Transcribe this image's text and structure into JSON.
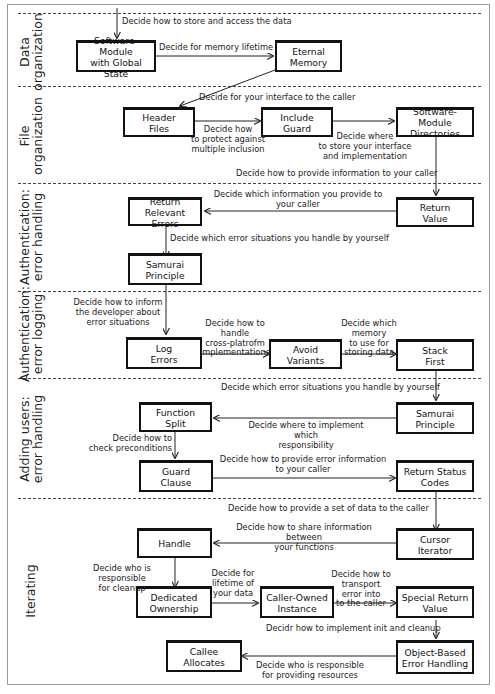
{
  "sections": [
    {
      "id": "data-organization",
      "label": "Data\norganization"
    },
    {
      "id": "file-organization",
      "label": "File\norganization"
    },
    {
      "id": "auth-error-handling",
      "label": "Authentication:\nerror handling"
    },
    {
      "id": "auth-error-logging",
      "label": "Authentication:\nerror logging"
    },
    {
      "id": "adding-users-error-handling",
      "label": "Adding users:\nerror handling"
    },
    {
      "id": "iterating",
      "label": "Iterating"
    }
  ],
  "nodes": {
    "software_module_global_state": "Software-Module\nwith Global State",
    "eternal_memory": "Eternal\nMemory",
    "header_files": "Header\nFiles",
    "include_guard": "Include\nGuard",
    "software_module_directories": "Software-Module\nDirectories",
    "return_value": "Return\nValue",
    "return_relevant_errors": "Return Relevant\nErrors",
    "samurai_principle_1": "Samurai\nPrinciple",
    "log_errors": "Log\nErrors",
    "avoid_variants": "Avoid\nVariants",
    "stack_first": "Stack\nFirst",
    "samurai_principle_2": "Samurai\nPrinciple",
    "function_split": "Function\nSplit",
    "guard_clause": "Guard\nClause",
    "return_status_codes": "Return Status\nCodes",
    "cursor_iterator": "Cursor\nIterator",
    "handle": "Handle",
    "dedicated_ownership": "Dedicated\nOwnership",
    "caller_owned_instance": "Caller-Owned\nInstance",
    "special_return_value": "Special Return\nValue",
    "object_based_error_handling": "Object-Based\nError Handling",
    "callee_allocates": "Callee\nAllocates"
  },
  "edges": {
    "start_to_global_state": "Decide how to store and access the data",
    "global_state_to_eternal": "Decide for memory lifetime",
    "eternal_to_header": "Decide for your interface to the caller",
    "header_to_guard": "Decide how\nto protect against\nmultiple inclusion",
    "guard_to_directories": "Decide where\nto store your interface\nand implementation",
    "directories_to_return_value": "Decide how to provide information to your caller",
    "return_value_to_relevant_errors": "Decide which information you provide to\nyour caller",
    "relevant_errors_to_samurai": "Decide which error situations you handle by yourself",
    "samurai_to_log_errors": "Decide how to inform\nthe developer about\nerror situations",
    "log_errors_to_avoid_variants": "Decide how to handle\ncross-platrofm\nimplementations",
    "avoid_variants_to_stack_first": "Decide which memory\nto use for\nstoring data",
    "stack_first_to_samurai2": "Decide which error situations you handle by yourself",
    "samurai2_to_function_split": "Decide where to implement which\nresponsibility",
    "function_split_to_guard_clause": "Decide how to\ncheck preconditions",
    "guard_clause_to_status_codes": "Decide how to provide error information\nto your caller",
    "status_codes_to_cursor": "Decide how to provide a set of data to the caller",
    "cursor_to_handle": "Decide how to share information between\nyour functions",
    "handle_to_dedicated": "Decide who is responsible\nfor cleanup",
    "dedicated_to_caller_owned": "Decide for\nlifetime of\nyour data",
    "caller_owned_to_special": "Decide how to transport\nerror into\nto the caller",
    "special_to_object_based": "Decidr how to implement init and cleanup",
    "object_based_to_callee": "Decide who is responsible\nfor providing resources"
  }
}
